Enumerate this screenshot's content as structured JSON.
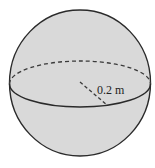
{
  "figure": {
    "shape": "sphere",
    "radius_label": "0.2 m",
    "colors": {
      "fill": "#d9d9d9",
      "stroke": "#2a2a2a",
      "background": "#ffffff"
    }
  }
}
